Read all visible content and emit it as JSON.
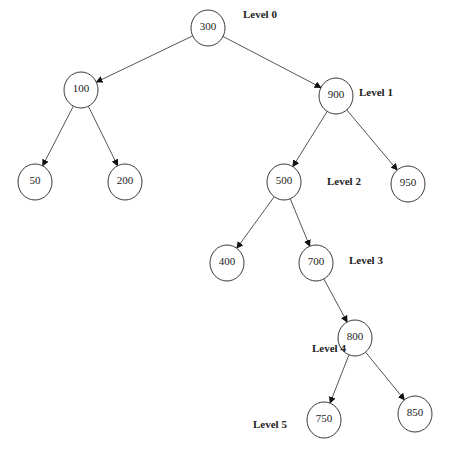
{
  "nodes": [
    {
      "id": "300",
      "label": "300",
      "level": 0
    },
    {
      "id": "100",
      "label": "100",
      "level": 1
    },
    {
      "id": "900",
      "label": "900",
      "level": 1
    },
    {
      "id": "50",
      "label": "50",
      "level": 2
    },
    {
      "id": "200",
      "label": "200",
      "level": 2
    },
    {
      "id": "500",
      "label": "500",
      "level": 2
    },
    {
      "id": "950",
      "label": "950",
      "level": 2
    },
    {
      "id": "400",
      "label": "400",
      "level": 3
    },
    {
      "id": "700",
      "label": "700",
      "level": 3
    },
    {
      "id": "800",
      "label": "800",
      "level": 4
    },
    {
      "id": "750",
      "label": "750",
      "level": 5
    },
    {
      "id": "850",
      "label": "850",
      "level": 5
    }
  ],
  "edges": [
    {
      "from": "300",
      "to": "100"
    },
    {
      "from": "300",
      "to": "900"
    },
    {
      "from": "100",
      "to": "50"
    },
    {
      "from": "100",
      "to": "200"
    },
    {
      "from": "900",
      "to": "500"
    },
    {
      "from": "900",
      "to": "950"
    },
    {
      "from": "500",
      "to": "400"
    },
    {
      "from": "500",
      "to": "700"
    },
    {
      "from": "700",
      "to": "800"
    },
    {
      "from": "800",
      "to": "750"
    },
    {
      "from": "800",
      "to": "850"
    }
  ],
  "level_labels": [
    {
      "id": "level-0",
      "text": "Level 0"
    },
    {
      "id": "level-1",
      "text": "Level 1"
    },
    {
      "id": "level-2",
      "text": "Level 2"
    },
    {
      "id": "level-3",
      "text": "Level 3"
    },
    {
      "id": "level-4",
      "text": "Level 4"
    },
    {
      "id": "level-5",
      "text": "Level 5"
    }
  ]
}
